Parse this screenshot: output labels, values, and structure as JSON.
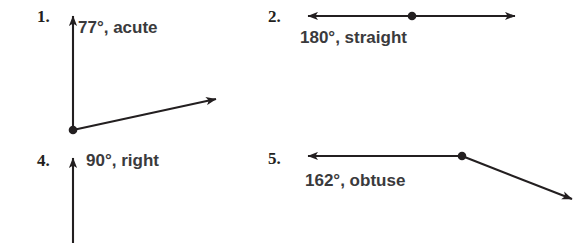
{
  "page": {
    "background_color": "#ffffff",
    "ink_color": "#231f20",
    "text_color": "#3a3a3c",
    "width": 584,
    "height": 243
  },
  "problems": [
    {
      "number": "1.",
      "answer": "77°, acute",
      "measure": "77",
      "classification": "acute",
      "figure": "angle-two-rays-up-and-right"
    },
    {
      "number": "2.",
      "answer": "180°, straight",
      "measure": "180",
      "classification": "straight",
      "figure": "angle-straight-line-double-arrow"
    },
    {
      "number": "4.",
      "answer": "90°, right",
      "measure": "90",
      "classification": "right",
      "figure": "angle-vertical-ray-up"
    },
    {
      "number": "5.",
      "answer": "162°, obtuse",
      "measure": "162",
      "classification": "obtuse",
      "figure": "angle-obtuse-left-ray-and-down-right-ray"
    }
  ]
}
